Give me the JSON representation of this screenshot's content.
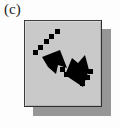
{
  "figure": {
    "subfigure_label": "(c)",
    "background_color": "#fdfdfd"
  },
  "button": {
    "icon_name": "resize-diagonal-arrow-icon",
    "icon_description": "double-headed diagonal arrow pointing inward, dashed tails",
    "face_color": "#c9c9c9",
    "border_color": "#3c3c3c",
    "shadow_color": "#969696",
    "icon_color": "#000000",
    "state": "raised"
  }
}
